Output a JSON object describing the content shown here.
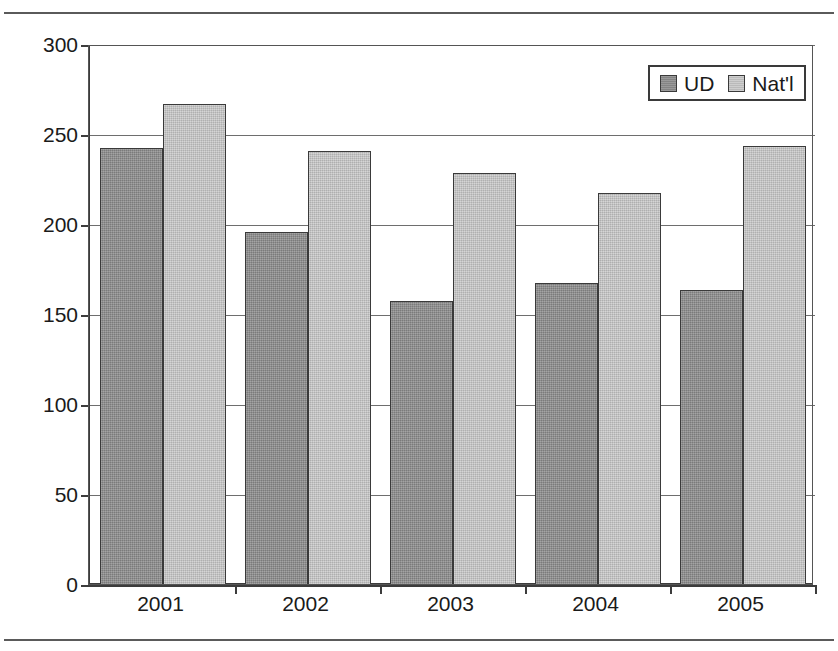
{
  "chart_data": {
    "type": "bar",
    "title": "",
    "xlabel": "",
    "ylabel": "",
    "categories": [
      "2001",
      "2002",
      "2003",
      "2004",
      "2005"
    ],
    "series": [
      {
        "name": "UD",
        "color": "#8e8e8e",
        "values": [
          243,
          196,
          158,
          168,
          164
        ]
      },
      {
        "name": "Nat'l",
        "color": "#c6c6c6",
        "values": [
          267,
          241,
          229,
          218,
          244
        ]
      }
    ],
    "ylim": [
      0,
      300
    ],
    "ytick_values": [
      0,
      50,
      100,
      150,
      200,
      250,
      300
    ],
    "ytick_labels": [
      "0",
      "50",
      "100",
      "150",
      "200",
      "250",
      "300"
    ],
    "grid": true,
    "legend_position": "top-right",
    "legend_entries": [
      "UD",
      "Nat'l"
    ]
  }
}
